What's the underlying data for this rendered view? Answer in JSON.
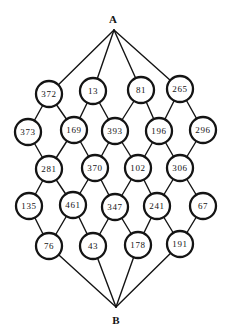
{
  "diagram": {
    "background_color": "#ffffff",
    "ink_color": "#141414",
    "node_fill": "#ffffff",
    "node_radius": 13,
    "node_stroke_width": 2.3,
    "edge_stroke_width": 1.4,
    "terminals": [
      {
        "id": "A",
        "label": "A",
        "x": 114,
        "y": 30,
        "label_x": 113,
        "label_y": 23
      },
      {
        "id": "B",
        "label": "B",
        "x": 116,
        "y": 307,
        "label_x": 116,
        "label_y": 324
      }
    ],
    "nodes": [
      {
        "id": "372",
        "value": "372",
        "x": 49,
        "y": 94
      },
      {
        "id": "13",
        "value": "13",
        "x": 93,
        "y": 91
      },
      {
        "id": "81",
        "value": "81",
        "x": 141,
        "y": 90
      },
      {
        "id": "265",
        "value": "265",
        "x": 180,
        "y": 89
      },
      {
        "id": "373",
        "value": "373",
        "x": 28,
        "y": 132
      },
      {
        "id": "169",
        "value": "169",
        "x": 74,
        "y": 130
      },
      {
        "id": "393",
        "value": "393",
        "x": 115,
        "y": 131
      },
      {
        "id": "196",
        "value": "196",
        "x": 159,
        "y": 131
      },
      {
        "id": "296",
        "value": "296",
        "x": 203,
        "y": 130
      },
      {
        "id": "281",
        "value": "281",
        "x": 49,
        "y": 169
      },
      {
        "id": "370",
        "value": "370",
        "x": 95,
        "y": 168
      },
      {
        "id": "102",
        "value": "102",
        "x": 138,
        "y": 168
      },
      {
        "id": "306",
        "value": "306",
        "x": 180,
        "y": 168
      },
      {
        "id": "135",
        "value": "135",
        "x": 29,
        "y": 206
      },
      {
        "id": "461",
        "value": "461",
        "x": 73,
        "y": 205
      },
      {
        "id": "347",
        "value": "347",
        "x": 115,
        "y": 207
      },
      {
        "id": "241",
        "value": "241",
        "x": 157,
        "y": 206
      },
      {
        "id": "67",
        "value": "67",
        "x": 203,
        "y": 206
      },
      {
        "id": "76",
        "value": "76",
        "x": 49,
        "y": 246
      },
      {
        "id": "43",
        "value": "43",
        "x": 93,
        "y": 246
      },
      {
        "id": "178",
        "value": "178",
        "x": 138,
        "y": 245
      },
      {
        "id": "191",
        "value": "191",
        "x": 180,
        "y": 244
      }
    ],
    "edges": [
      [
        "A",
        "372"
      ],
      [
        "A",
        "13"
      ],
      [
        "A",
        "81"
      ],
      [
        "A",
        "265"
      ],
      [
        "372",
        "373"
      ],
      [
        "372",
        "169"
      ],
      [
        "13",
        "169"
      ],
      [
        "13",
        "393"
      ],
      [
        "81",
        "393"
      ],
      [
        "81",
        "196"
      ],
      [
        "265",
        "196"
      ],
      [
        "265",
        "296"
      ],
      [
        "373",
        "281"
      ],
      [
        "169",
        "281"
      ],
      [
        "169",
        "370"
      ],
      [
        "393",
        "370"
      ],
      [
        "393",
        "102"
      ],
      [
        "196",
        "102"
      ],
      [
        "196",
        "306"
      ],
      [
        "296",
        "306"
      ],
      [
        "281",
        "135"
      ],
      [
        "281",
        "461"
      ],
      [
        "370",
        "461"
      ],
      [
        "370",
        "347"
      ],
      [
        "102",
        "347"
      ],
      [
        "102",
        "241"
      ],
      [
        "306",
        "241"
      ],
      [
        "306",
        "67"
      ],
      [
        "135",
        "76"
      ],
      [
        "461",
        "76"
      ],
      [
        "461",
        "43"
      ],
      [
        "347",
        "43"
      ],
      [
        "347",
        "178"
      ],
      [
        "241",
        "178"
      ],
      [
        "241",
        "191"
      ],
      [
        "67",
        "191"
      ],
      [
        "76",
        "B"
      ],
      [
        "43",
        "B"
      ],
      [
        "178",
        "B"
      ],
      [
        "191",
        "B"
      ]
    ]
  }
}
